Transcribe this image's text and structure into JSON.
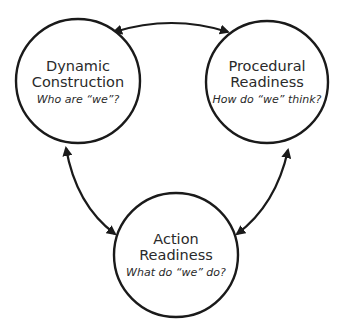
{
  "diagram": {
    "type": "cycle",
    "colors": {
      "stroke": "#1a1a1a",
      "text": "#2a2a2a",
      "background": "#ffffff"
    },
    "nodes": [
      {
        "id": "dynamic",
        "title_line1": "Dynamic",
        "title_line2": "Construction",
        "subtitle": "Who are “we”?"
      },
      {
        "id": "procedural",
        "title_line1": "Procedural",
        "title_line2": "Readiness",
        "subtitle": "How do “we” think?"
      },
      {
        "id": "action",
        "title_line1": "Action",
        "title_line2": "Readiness",
        "subtitle": "What do “we” do?"
      }
    ],
    "edges": [
      {
        "from": "dynamic",
        "to": "procedural",
        "bidirectional": true
      },
      {
        "from": "dynamic",
        "to": "action",
        "bidirectional": true
      },
      {
        "from": "procedural",
        "to": "action",
        "bidirectional": true
      }
    ]
  }
}
